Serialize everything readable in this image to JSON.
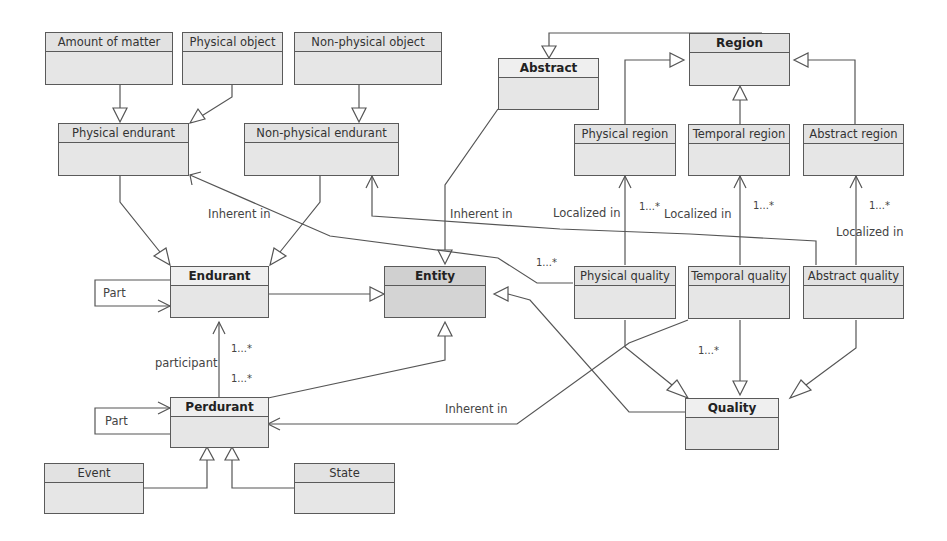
{
  "diagram": {
    "type": "UML class diagram (ontology)",
    "classes": {
      "amount_of_matter": "Amount of matter",
      "physical_object": "Physical object",
      "non_physical_object": "Non-physical object",
      "abstract": "Abstract",
      "region": "Region",
      "physical_endurant": "Physical endurant",
      "non_physical_endurant": "Non-physical endurant",
      "physical_region": "Physical region",
      "temporal_region": "Temporal region",
      "abstract_region": "Abstract region",
      "endurant": "Endurant",
      "entity": "Entity",
      "physical_quality": "Physical quality",
      "temporal_quality": "Temporal quality",
      "abstract_quality": "Abstract quality",
      "perdurant": "Perdurant",
      "quality": "Quality",
      "event": "Event",
      "state": "State"
    },
    "labels": {
      "inherent_in_1": "Inherent in",
      "inherent_in_2": "Inherent in",
      "inherent_in_3": "Inherent in",
      "localized_in_1": "Localized in",
      "localized_in_2": "Localized in",
      "localized_in_3": "Localized in",
      "mult_pq_region": "1...*",
      "mult_tq_region": "1...*",
      "mult_aq_region": "1...*",
      "mult_pq_inherent": "1...*",
      "mult_quality": "1...*",
      "mult_participant_top": "1...*",
      "mult_participant_bottom": "1...*",
      "participant": "participant",
      "part_endurant": "Part",
      "part_perdurant": "Part"
    }
  }
}
